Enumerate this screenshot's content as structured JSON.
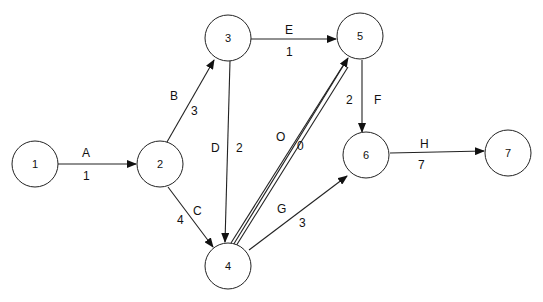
{
  "diagram": {
    "type": "activity-network",
    "nodes": [
      {
        "id": "1",
        "label": "1",
        "x": 35,
        "y": 164
      },
      {
        "id": "2",
        "label": "2",
        "x": 160,
        "y": 164
      },
      {
        "id": "3",
        "label": "3",
        "x": 228,
        "y": 38
      },
      {
        "id": "4",
        "label": "4",
        "x": 228,
        "y": 266
      },
      {
        "id": "5",
        "label": "5",
        "x": 360,
        "y": 36
      },
      {
        "id": "6",
        "label": "6",
        "x": 366,
        "y": 155
      },
      {
        "id": "7",
        "label": "7",
        "x": 508,
        "y": 153
      }
    ],
    "edges": [
      {
        "from": "1",
        "to": "2",
        "activity": "A",
        "duration": "1"
      },
      {
        "from": "2",
        "to": "3",
        "activity": "B",
        "duration": "3"
      },
      {
        "from": "2",
        "to": "4",
        "activity": "C",
        "duration": "4"
      },
      {
        "from": "3",
        "to": "4",
        "activity": "D",
        "duration": "2"
      },
      {
        "from": "3",
        "to": "5",
        "activity": "E",
        "duration": "1"
      },
      {
        "from": "5",
        "to": "6",
        "activity": "F",
        "duration": "2"
      },
      {
        "from": "4",
        "to": "6",
        "activity": "G",
        "duration": "3"
      },
      {
        "from": "6",
        "to": "7",
        "activity": "H",
        "duration": "7"
      },
      {
        "from": "4",
        "to": "5",
        "activity": "O",
        "duration": "0",
        "style": "double"
      }
    ]
  }
}
